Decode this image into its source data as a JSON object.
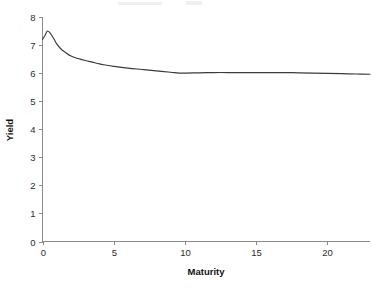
{
  "chart_data": {
    "type": "line",
    "title": "",
    "xlabel": "Maturity",
    "ylabel": "Yield",
    "xlim": [
      0,
      23
    ],
    "ylim": [
      0,
      8
    ],
    "xticks": [
      0,
      5,
      10,
      15,
      20
    ],
    "yticks": [
      0,
      1,
      2,
      3,
      4,
      5,
      6,
      7,
      8
    ],
    "xtick_labels": [
      "0",
      "5",
      "10",
      "15",
      "20"
    ],
    "ytick_labels": [
      "0",
      "1",
      "2",
      "3",
      "4",
      "5",
      "6",
      "7",
      "8"
    ],
    "grid": false,
    "legend": false,
    "legend_position": "none",
    "line_color": "#3a3a3a",
    "axis_color": "#8a8a8a",
    "series": [
      {
        "name": "Yield curve",
        "x": [
          0.0,
          0.15,
          0.35,
          0.55,
          0.8,
          1.0,
          1.3,
          1.6,
          2.0,
          2.5,
          3.0,
          3.5,
          4.0,
          4.3,
          5.0,
          6.0,
          7.0,
          8.0,
          9.0,
          9.6,
          10.0,
          11.0,
          12.0,
          13.0,
          14.0,
          15.0,
          16.0,
          17.0,
          18.0,
          19.0,
          20.0,
          21.0,
          22.0,
          23.0
        ],
        "y": [
          7.2,
          7.32,
          7.5,
          7.42,
          7.22,
          7.04,
          6.86,
          6.74,
          6.61,
          6.52,
          6.45,
          6.39,
          6.33,
          6.3,
          6.24,
          6.18,
          6.13,
          6.08,
          6.03,
          6.0,
          6.0,
          6.01,
          6.02,
          6.02,
          6.02,
          6.02,
          6.02,
          6.02,
          6.01,
          6.0,
          5.99,
          5.98,
          5.97,
          5.96
        ]
      }
    ]
  }
}
